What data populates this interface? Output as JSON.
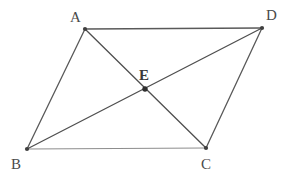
{
  "figure": {
    "kind": "parallelogram-with-diagonals",
    "canvas": {
      "width": 293,
      "height": 183,
      "background": "#ffffff"
    },
    "colors": {
      "side_dark": "#595959",
      "side_light": "#8d8d8d",
      "diagonal": "#4f4f4f",
      "vertex_dot": "#3f3f3f",
      "label": "#4a4a4a"
    },
    "vertices": [
      {
        "id": "A",
        "label": "A",
        "x": 85,
        "y": 29,
        "label_x": 70,
        "label_y": 10,
        "bold": false
      },
      {
        "id": "D",
        "label": "D",
        "x": 262,
        "y": 28,
        "label_x": 266,
        "label_y": 8,
        "bold": false
      },
      {
        "id": "B",
        "label": "B",
        "x": 27,
        "y": 149,
        "label_x": 11,
        "label_y": 157,
        "bold": false
      },
      {
        "id": "C",
        "label": "C",
        "x": 206,
        "y": 148,
        "label_x": 201,
        "label_y": 157,
        "bold": false
      },
      {
        "id": "E",
        "label": "E",
        "x": 145,
        "y": 89,
        "label_x": 139,
        "label_y": 68,
        "bold": true
      }
    ],
    "edges": [
      {
        "id": "AD",
        "from": "A",
        "to": "D",
        "style": "side-dark",
        "width": 1.6
      },
      {
        "id": "BC",
        "from": "B",
        "to": "C",
        "style": "side-light",
        "width": 1.2
      },
      {
        "id": "AB",
        "from": "A",
        "to": "B",
        "style": "side-dark",
        "width": 1.3
      },
      {
        "id": "DC",
        "from": "D",
        "to": "C",
        "style": "side-dark",
        "width": 1.3
      },
      {
        "id": "AC",
        "from": "A",
        "to": "C",
        "style": "diagonal",
        "width": 1.3
      },
      {
        "id": "BD",
        "from": "B",
        "to": "D",
        "style": "diagonal",
        "width": 1.3
      }
    ],
    "intersection_point": {
      "id": "E",
      "of": [
        "AC",
        "BD"
      ],
      "x": 145,
      "y": 89,
      "radius": 2.6
    }
  }
}
